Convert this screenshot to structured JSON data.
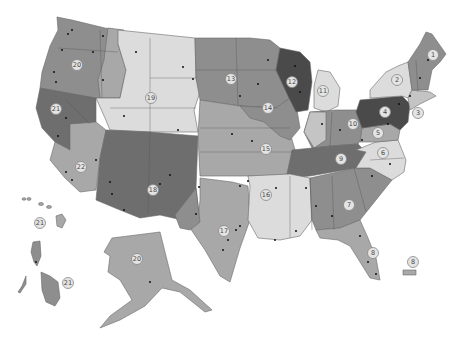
{
  "map": {
    "title": "",
    "colors": {
      "lightest": "#dcdcdc",
      "light": "#c4c4c4",
      "medium": "#a8a8a8",
      "medium_dark": "#8e8e8e",
      "dark": "#6e6e6e",
      "darkest": "#4a4a4a",
      "badge_fill": "#e4e4e4",
      "city_dot": "#111111"
    },
    "regions": [
      {
        "id": "1",
        "label": "1",
        "area": "Maine / New Hampshire / Vermont",
        "shade": "medium_dark",
        "badge": [
          433,
          55
        ]
      },
      {
        "id": "2",
        "label": "2",
        "area": "New York",
        "shade": "lightest",
        "badge": [
          397,
          80
        ]
      },
      {
        "id": "3",
        "label": "3",
        "area": "Connecticut / New Jersey coast",
        "shade": "light",
        "badge": [
          418,
          113
        ]
      },
      {
        "id": "4",
        "label": "4",
        "area": "Pennsylvania",
        "shade": "darkest",
        "badge": [
          385,
          112
        ]
      },
      {
        "id": "5",
        "label": "5",
        "area": "Maryland / Delaware",
        "shade": "medium",
        "badge": [
          378,
          133
        ]
      },
      {
        "id": "6",
        "label": "6",
        "area": "Virginia",
        "shade": "lightest",
        "badge": [
          383,
          153
        ]
      },
      {
        "id": "7",
        "label": "7",
        "area": "Georgia / South Carolina",
        "shade": "medium_dark",
        "badge": [
          349,
          205
        ]
      },
      {
        "id": "8",
        "label": "8",
        "area": "Florida",
        "shade": "medium",
        "badge": [
          373,
          253
        ]
      },
      {
        "id": "8b",
        "label": "8",
        "area": "Puerto Rico",
        "shade": "medium",
        "badge": [
          413,
          262
        ]
      },
      {
        "id": "9",
        "label": "9",
        "area": "Kentucky / Tennessee",
        "shade": "dark",
        "badge": [
          341,
          159
        ]
      },
      {
        "id": "10",
        "label": "10",
        "area": "Ohio / West Virginia",
        "shade": "medium_dark",
        "badge": [
          353,
          124
        ]
      },
      {
        "id": "11",
        "label": "11",
        "area": "Michigan",
        "shade": "lightest",
        "badge": [
          323,
          91
        ]
      },
      {
        "id": "12",
        "label": "12",
        "area": "Wisconsin",
        "shade": "darkest",
        "badge": [
          292,
          82
        ]
      },
      {
        "id": "13",
        "label": "13",
        "area": "North Dakota / South Dakota / Minnesota",
        "shade": "medium_dark",
        "badge": [
          231,
          79
        ]
      },
      {
        "id": "14",
        "label": "14",
        "area": "Iowa / Missouri / Illinois",
        "shade": "medium_dark",
        "badge": [
          268,
          108
        ]
      },
      {
        "id": "15",
        "label": "15",
        "area": "Kansas / Oklahoma / Missouri",
        "shade": "medium",
        "badge": [
          266,
          149
        ]
      },
      {
        "id": "16",
        "label": "16",
        "area": "Arkansas / Louisiana / Mississippi",
        "shade": "lightest",
        "badge": [
          266,
          195
        ]
      },
      {
        "id": "17",
        "label": "17",
        "area": "Texas",
        "shade": "medium",
        "badge": [
          224,
          231
        ]
      },
      {
        "id": "18",
        "label": "18",
        "area": "Arizona / New Mexico",
        "shade": "dark",
        "badge": [
          153,
          190
        ]
      },
      {
        "id": "19",
        "label": "19",
        "area": "Wyoming / Utah / Colorado",
        "shade": "lightest",
        "badge": [
          151,
          98
        ]
      },
      {
        "id": "20",
        "label": "20",
        "area": "Washington / Oregon / Idaho",
        "shade": "medium_dark",
        "badge": [
          77,
          65
        ]
      },
      {
        "id": "20b",
        "label": "20",
        "area": "Alaska",
        "shade": "medium",
        "badge": [
          137,
          259
        ]
      },
      {
        "id": "21",
        "label": "21",
        "area": "Northern California / Nevada",
        "shade": "dark",
        "badge": [
          56,
          109
        ]
      },
      {
        "id": "21b",
        "label": "21",
        "area": "Hawaii",
        "shade": "medium",
        "badge": [
          40,
          223
        ]
      },
      {
        "id": "21c",
        "label": "21",
        "area": "Philippines",
        "shade": "medium_dark",
        "badge": [
          68,
          283
        ]
      },
      {
        "id": "22",
        "label": "22",
        "area": "Southern California",
        "shade": "medium",
        "badge": [
          81,
          167
        ]
      }
    ]
  }
}
